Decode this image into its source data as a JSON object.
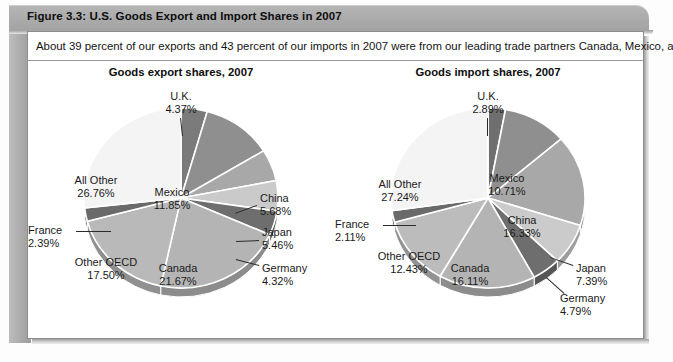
{
  "figure": {
    "header_title": "Figure 3.3: U.S. Goods Export and Import Shares in 2007",
    "caption": "About 39 percent of our exports and 43 percent of our imports in 2007 were from our leading trade partners Canada, Mexico, and China."
  },
  "chart_data": [
    {
      "type": "pie",
      "id": "goods-export-shares",
      "title": "Goods export shares, 2007",
      "unit": "percent",
      "legend": "none",
      "categories": [
        "U.K.",
        "Mexico",
        "China",
        "Japan",
        "Germany",
        "Canada",
        "Other OECD",
        "France",
        "All Other"
      ],
      "values": [
        4.37,
        11.85,
        5.68,
        5.46,
        4.32,
        21.67,
        17.5,
        2.39,
        26.76
      ],
      "labels": [
        {
          "name": "U.K.",
          "value": "4.37%"
        },
        {
          "name": "Mexico",
          "value": "11.85%"
        },
        {
          "name": "China",
          "value": "5.68%"
        },
        {
          "name": "Japan",
          "value": "5.46%"
        },
        {
          "name": "Germany",
          "value": "4.32%"
        },
        {
          "name": "Canada",
          "value": "21.67%"
        },
        {
          "name": "Other OECD",
          "value": "17.50%"
        },
        {
          "name": "France",
          "value": "2.39%"
        },
        {
          "name": "All Other",
          "value": "26.76%"
        }
      ],
      "slice_colors": [
        "#7b7b7b",
        "#8f8f8f",
        "#a8a8a8",
        "#cacaca",
        "#6e6e6e",
        "#b4b4b4",
        "#b9b9b9",
        "#6a6a6a",
        "#f4f4f4"
      ]
    },
    {
      "type": "pie",
      "id": "goods-import-shares",
      "title": "Goods import shares, 2007",
      "unit": "percent",
      "legend": "none",
      "categories": [
        "U.K.",
        "Mexico",
        "China",
        "Japan",
        "Germany",
        "Canada",
        "Other OECD",
        "France",
        "All Other"
      ],
      "values": [
        2.89,
        10.71,
        16.33,
        7.39,
        4.79,
        16.11,
        12.43,
        2.11,
        27.24
      ],
      "labels": [
        {
          "name": "U.K.",
          "value": "2.89%"
        },
        {
          "name": "Mexico",
          "value": "10.71%"
        },
        {
          "name": "China",
          "value": "16.33%"
        },
        {
          "name": "Japan",
          "value": "7.39%"
        },
        {
          "name": "Germany",
          "value": "4.79%"
        },
        {
          "name": "Canada",
          "value": "16.11%"
        },
        {
          "name": "Other OECD",
          "value": "12.43%"
        },
        {
          "name": "France",
          "value": "2.11%"
        },
        {
          "name": "All Other",
          "value": "27.24%"
        }
      ],
      "slice_colors": [
        "#6f6f6f",
        "#8f8f8f",
        "#a8a8a8",
        "#cbcbcb",
        "#6e6e6e",
        "#b4b4b4",
        "#bcbcbc",
        "#6a6a6a",
        "#f4f4f4"
      ]
    }
  ],
  "colors": {
    "header_bar": "#aeaeae",
    "card_border": "#8d8d8d",
    "text": "#1a1a1a"
  }
}
